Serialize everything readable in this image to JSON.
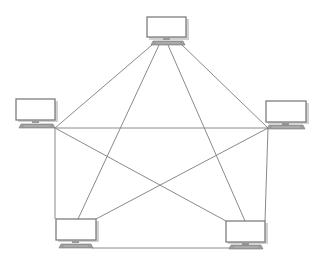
{
  "diagram": {
    "type": "full-mesh",
    "line_color": "#8a8a8a",
    "nodes": [
      {
        "id": "top",
        "label": "",
        "icon": "computer-icon",
        "x": 147,
        "y": 17
      },
      {
        "id": "left",
        "label": "",
        "icon": "computer-icon",
        "x": 16,
        "y": 99
      },
      {
        "id": "right",
        "label": "",
        "icon": "computer-icon",
        "x": 266,
        "y": 101
      },
      {
        "id": "bottom-left",
        "label": "",
        "icon": "computer-icon",
        "x": 56,
        "y": 219
      },
      {
        "id": "bottom-right",
        "label": "",
        "icon": "computer-icon",
        "x": 226,
        "y": 221
      }
    ],
    "links": [
      {
        "from": "top",
        "to": "left"
      },
      {
        "from": "top",
        "to": "right"
      },
      {
        "from": "top",
        "to": "bottom-left"
      },
      {
        "from": "top",
        "to": "bottom-right"
      },
      {
        "from": "left",
        "to": "right"
      },
      {
        "from": "left",
        "to": "bottom-left"
      },
      {
        "from": "left",
        "to": "bottom-right"
      },
      {
        "from": "right",
        "to": "bottom-left"
      },
      {
        "from": "right",
        "to": "bottom-right"
      },
      {
        "from": "bottom-left",
        "to": "bottom-right"
      }
    ]
  }
}
